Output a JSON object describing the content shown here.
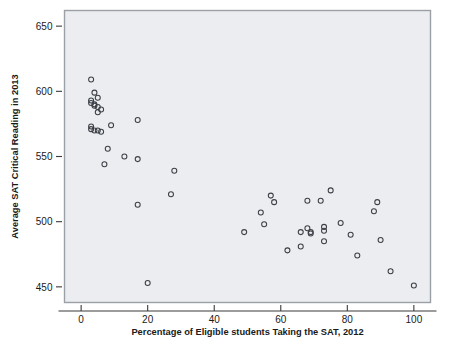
{
  "chart_data": {
    "type": "scatter",
    "title": "",
    "xlabel": "Percentage of Eligible students Taking the SAT, 2012",
    "ylabel": "Average SAT Critical Reading in 2013",
    "xlim": [
      -5,
      105
    ],
    "ylim": [
      438,
      662
    ],
    "xticks": [
      0,
      20,
      40,
      60,
      80,
      100
    ],
    "xtick_labels": [
      "0",
      "20",
      "40",
      "60",
      "80",
      "100"
    ],
    "yticks": [
      450,
      500,
      550,
      600,
      650
    ],
    "ytick_labels": [
      "450",
      "500",
      "550",
      "600",
      "650"
    ],
    "grid": false,
    "legend": "none",
    "marker": "open-circle",
    "marker_color": "#3c3f46",
    "plot_background": "#e8ebee",
    "frame_color": "#9aa0a6",
    "points": [
      {
        "x": 3,
        "y": 609
      },
      {
        "x": 4,
        "y": 599
      },
      {
        "x": 3,
        "y": 593
      },
      {
        "x": 3,
        "y": 591
      },
      {
        "x": 5,
        "y": 595
      },
      {
        "x": 4,
        "y": 590
      },
      {
        "x": 4,
        "y": 589
      },
      {
        "x": 5,
        "y": 588
      },
      {
        "x": 6,
        "y": 586
      },
      {
        "x": 5,
        "y": 584
      },
      {
        "x": 3,
        "y": 573
      },
      {
        "x": 3,
        "y": 571
      },
      {
        "x": 4,
        "y": 570
      },
      {
        "x": 5,
        "y": 570
      },
      {
        "x": 6,
        "y": 569
      },
      {
        "x": 9,
        "y": 574
      },
      {
        "x": 17,
        "y": 578
      },
      {
        "x": 8,
        "y": 556
      },
      {
        "x": 7,
        "y": 544
      },
      {
        "x": 13,
        "y": 550
      },
      {
        "x": 17,
        "y": 548
      },
      {
        "x": 28,
        "y": 539
      },
      {
        "x": 27,
        "y": 521
      },
      {
        "x": 17,
        "y": 513
      },
      {
        "x": 20,
        "y": 453
      },
      {
        "x": 49,
        "y": 492
      },
      {
        "x": 54,
        "y": 507
      },
      {
        "x": 55,
        "y": 498
      },
      {
        "x": 57,
        "y": 520
      },
      {
        "x": 58,
        "y": 515
      },
      {
        "x": 62,
        "y": 478
      },
      {
        "x": 66,
        "y": 481
      },
      {
        "x": 66,
        "y": 492
      },
      {
        "x": 68,
        "y": 495
      },
      {
        "x": 68,
        "y": 516
      },
      {
        "x": 69,
        "y": 492
      },
      {
        "x": 69,
        "y": 491
      },
      {
        "x": 72,
        "y": 516
      },
      {
        "x": 73,
        "y": 496
      },
      {
        "x": 73,
        "y": 493
      },
      {
        "x": 73,
        "y": 485
      },
      {
        "x": 75,
        "y": 524
      },
      {
        "x": 78,
        "y": 499
      },
      {
        "x": 81,
        "y": 490
      },
      {
        "x": 83,
        "y": 474
      },
      {
        "x": 88,
        "y": 508
      },
      {
        "x": 89,
        "y": 515
      },
      {
        "x": 90,
        "y": 486
      },
      {
        "x": 93,
        "y": 462
      },
      {
        "x": 100,
        "y": 451
      }
    ]
  }
}
